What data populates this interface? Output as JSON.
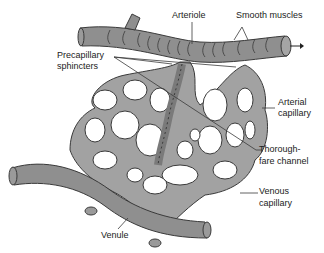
{
  "figure": {
    "type": "anatomical-diagram",
    "colors": {
      "vessel_fill": "#8f8f8f",
      "vessel_outline": "#3a3a3a",
      "capillary_fill": "#a2a2a2",
      "background": "#ffffff",
      "text": "#222222"
    },
    "labels": {
      "arteriole": "Arteriole",
      "smooth_muscles": "Smooth muscles",
      "precapillary_line1": "Precapillary",
      "precapillary_line2": "sphincters",
      "arterial_line1": "Arterial",
      "arterial_line2": "capillary",
      "thoroughfare_line1": "Thorough-",
      "thoroughfare_line2": "fare channel",
      "venous_line1": "Venous",
      "venous_line2": "capillary",
      "venule": "Venule"
    }
  }
}
